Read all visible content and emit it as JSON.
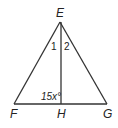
{
  "diagram": {
    "type": "triangle-with-altitude",
    "stroke_color": "#333333",
    "vertices": {
      "E": {
        "label": "E",
        "x": 60,
        "y": 22
      },
      "F": {
        "label": "F",
        "x": 14,
        "y": 104
      },
      "G": {
        "label": "G",
        "x": 107,
        "y": 104
      },
      "H": {
        "label": "H",
        "x": 61,
        "y": 104
      }
    },
    "segments": [
      "EF",
      "EG",
      "FG",
      "EH"
    ],
    "angle_labels": {
      "angle1": "1",
      "angle2": "2",
      "angle_EHF": "15x°"
    }
  }
}
